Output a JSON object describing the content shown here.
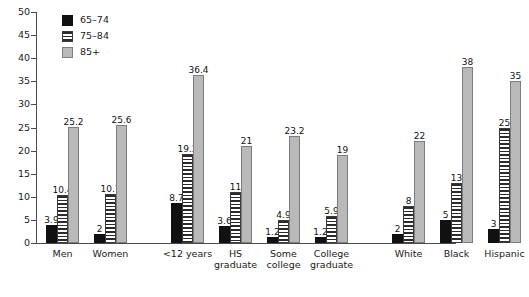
{
  "chart_data": {
    "type": "bar",
    "title": "",
    "subtitle": "",
    "xlabel": "",
    "ylabel": "",
    "ylim": [
      0,
      50
    ],
    "yticks": [
      0,
      5,
      10,
      15,
      20,
      25,
      30,
      35,
      40,
      45,
      50
    ],
    "grid": false,
    "legend_position": "top-left",
    "categories": [
      "Men",
      "Women",
      "<12 years",
      "HS graduate",
      "Some college",
      "College graduate",
      "White",
      "Black",
      "Hispanic"
    ],
    "category_lines": [
      [
        "Men"
      ],
      [
        "Women"
      ],
      [
        "<12 years"
      ],
      [
        "HS",
        "graduate"
      ],
      [
        "Some",
        "college"
      ],
      [
        "College",
        "graduate"
      ],
      [
        "White"
      ],
      [
        "Black"
      ],
      [
        "Hispanic"
      ]
    ],
    "series": [
      {
        "name": "65–74",
        "color": "#111111",
        "pattern": "solid",
        "values": [
          3.9,
          2,
          8.7,
          3.6,
          1.2,
          1.2,
          2,
          5,
          3
        ],
        "labels": [
          "3.9",
          "2",
          "8.7",
          "3.6",
          "1.2",
          "1.2",
          "2",
          "5",
          "3"
        ]
      },
      {
        "name": "75–84",
        "color": "#2b2b2b",
        "pattern": "horizontal-stripes",
        "values": [
          10.4,
          10.7,
          19.3,
          11,
          4.9,
          5.9,
          8,
          13,
          25
        ],
        "labels": [
          "10.4",
          "10.7",
          "19.3",
          "11",
          "4.9",
          "5.9",
          "8",
          "13",
          "25"
        ]
      },
      {
        "name": "85+",
        "color": "#b9b9b9",
        "pattern": "solid-gray",
        "values": [
          25.2,
          25.6,
          36.4,
          21,
          23.2,
          19,
          22,
          38,
          35
        ],
        "labels": [
          "25.2",
          "25.6",
          "36.4",
          "21",
          "23.2",
          "19",
          "22",
          "38",
          "35"
        ]
      }
    ],
    "group_blocks": [
      {
        "name": "sex",
        "categories": [
          "Men",
          "Women"
        ]
      },
      {
        "name": "education",
        "categories": [
          "<12 years",
          "HS graduate",
          "Some college",
          "College graduate"
        ]
      },
      {
        "name": "race-ethnicity",
        "categories": [
          "White",
          "Black",
          "Hispanic"
        ]
      }
    ]
  },
  "legend": {
    "items": [
      {
        "label": "65–74"
      },
      {
        "label": "75–84"
      },
      {
        "label": "85+"
      }
    ]
  }
}
